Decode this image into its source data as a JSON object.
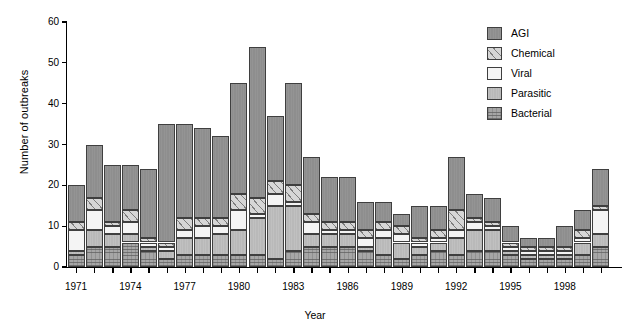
{
  "chart_data": {
    "type": "bar",
    "subtype": "stacked-vertical",
    "title": "",
    "xlabel": "Year",
    "ylabel": "Number of outbreaks",
    "ylim": [
      0,
      60
    ],
    "yticks": [
      0,
      10,
      20,
      30,
      40,
      50,
      60
    ],
    "grid": false,
    "legend_position": "top-right",
    "legend": [
      "AGI",
      "Chemical",
      "Viral",
      "Parasitic",
      "Bacterial"
    ],
    "stack_order_bottom_to_top": [
      "Bacterial",
      "Parasitic",
      "Viral",
      "Chemical",
      "AGI"
    ],
    "colors": {
      "AGI": "#8e8e8e",
      "Chemical": "#d6d6d6",
      "Viral": "#f4f4f4",
      "Parasitic": "#b9b9b9",
      "Bacterial": "#a6a6a6"
    },
    "categories": [
      1971,
      1972,
      1973,
      1974,
      1975,
      1976,
      1977,
      1978,
      1979,
      1980,
      1981,
      1982,
      1983,
      1984,
      1985,
      1986,
      1987,
      1988,
      1989,
      1990,
      1991,
      1992,
      1993,
      1994,
      1995,
      1996,
      1997,
      1998,
      1999,
      2000
    ],
    "xtick_labels": [
      "1971",
      "1974",
      "1977",
      "1980",
      "1983",
      "1986",
      "1989",
      "1992",
      "1995",
      "1998"
    ],
    "xtick_values": [
      1971,
      1974,
      1977,
      1980,
      1983,
      1986,
      1989,
      1992,
      1995,
      1998
    ],
    "series": [
      {
        "name": "Bacterial",
        "values": [
          3,
          5,
          5,
          6,
          4,
          2,
          3,
          3,
          3,
          3,
          3,
          2,
          4,
          5,
          5,
          5,
          4,
          3,
          2,
          3,
          4,
          3,
          4,
          4,
          3,
          2,
          2,
          2,
          3,
          5
        ]
      },
      {
        "name": "Parasitic",
        "values": [
          1,
          4,
          3,
          2,
          1,
          2,
          4,
          4,
          5,
          6,
          9,
          13,
          11,
          3,
          3,
          3,
          1,
          4,
          4,
          2,
          2,
          4,
          5,
          5,
          1,
          1,
          1,
          1,
          3,
          3
        ]
      },
      {
        "name": "Viral",
        "values": [
          5,
          5,
          2,
          3,
          1,
          1,
          2,
          3,
          2,
          5,
          1,
          3,
          1,
          3,
          1,
          1,
          2,
          2,
          2,
          1,
          1,
          2,
          2,
          1,
          1,
          1,
          1,
          1,
          1,
          6
        ]
      },
      {
        "name": "Chemical",
        "values": [
          2,
          3,
          1,
          3,
          1,
          1,
          3,
          2,
          2,
          4,
          4,
          3,
          4,
          2,
          2,
          2,
          2,
          2,
          2,
          1,
          2,
          5,
          1,
          1,
          1,
          1,
          1,
          1,
          2,
          1
        ]
      },
      {
        "name": "AGI",
        "values": [
          9,
          13,
          14,
          11,
          17,
          29,
          23,
          22,
          20,
          27,
          37,
          16,
          25,
          14,
          11,
          11,
          7,
          5,
          3,
          8,
          6,
          13,
          6,
          6,
          4,
          2,
          2,
          5,
          5,
          9
        ]
      }
    ],
    "totals": [
      20,
      30,
      25,
      25,
      24,
      35,
      35,
      34,
      32,
      45,
      54,
      37,
      45,
      27,
      22,
      22,
      16,
      16,
      13,
      15,
      15,
      27,
      18,
      17,
      10,
      7,
      7,
      10,
      14,
      24
    ]
  },
  "axes": {
    "ylabel": "Number of outbreaks",
    "xlabel": "Year"
  },
  "legend_items": [
    {
      "label": "AGI",
      "key": "agi"
    },
    {
      "label": "Chemical",
      "key": "chemical"
    },
    {
      "label": "Viral",
      "key": "viral"
    },
    {
      "label": "Parasitic",
      "key": "parasitic"
    },
    {
      "label": "Bacterial",
      "key": "bacterial"
    }
  ]
}
